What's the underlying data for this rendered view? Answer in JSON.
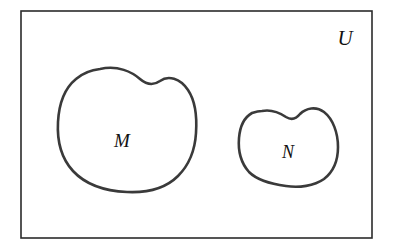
{
  "figure": {
    "kind": "venn-diagram",
    "width": 393,
    "height": 250,
    "background_color": "#ffffff"
  },
  "universe": {
    "label": "U",
    "label_x": 345,
    "label_y": 45,
    "rect": {
      "x": 21,
      "y": 11,
      "width": 351,
      "height": 227
    },
    "stroke_color": "#2b2b2b",
    "stroke_width": 1.6,
    "fill_color": "#ffffff"
  },
  "sets": [
    {
      "name": "set-m",
      "label": "M",
      "label_x": 122,
      "label_y": 147,
      "stroke_color": "#3a3a3a",
      "stroke_width": 2.6,
      "fill_color": "#ffffff",
      "path": "M 100,69 C 118,65 132,72 140,79 C 147,85 153,86 160,81 C 168,75 180,78 188,90 C 196,102 197,118 196,133 C 195,150 189,165 178,176 C 166,188 148,193 127,192 C 105,191 85,184 73,171 C 61,158 57,140 58,122 C 59,104 65,88 76,79 C 83,73 91,70 100,69 Z"
    },
    {
      "name": "set-n",
      "label": "N",
      "label_x": 288,
      "label_y": 158,
      "stroke_color": "#3a3a3a",
      "stroke_width": 2.6,
      "fill_color": "#ffffff",
      "path": "M 262,111 C 272,109 280,113 286,117 C 291,120 296,119 300,114 C 306,108 316,106 324,112 C 333,119 338,133 338,147 C 338,161 333,172 324,179 C 314,186 299,188 286,186 C 271,184 257,180 249,172 C 241,163 238,150 239,138 C 240,126 245,117 252,113 C 255,112 259,111 262,111 Z"
    }
  ]
}
